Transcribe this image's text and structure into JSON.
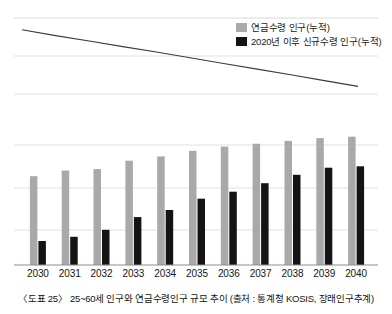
{
  "caption": "〈도표 25〉 25~60세 인구와 연금수령인구 규모 추이 (출처 : 통계청 KOSIS, 장래인구추계)",
  "legend": {
    "items": [
      {
        "label": "연금수령 인구(누적)",
        "color": "#a9a9a9",
        "swatch_name": "legend-swatch-gray"
      },
      {
        "label": "2020년 이후 신규수령 인구(누적)",
        "color": "#141414",
        "swatch_name": "legend-swatch-black"
      }
    ]
  },
  "colors": {
    "series_pension": "#a9a9a9",
    "series_new": "#141414",
    "line": "#3a3a3a",
    "grid": "#d9d9d9",
    "axis": "#8c8c8c"
  },
  "chart_data": [
    {
      "type": "line",
      "title": "",
      "xlabel": "",
      "ylabel": "",
      "grid": true,
      "legend_position": "top-right",
      "series": [
        {
          "name": "25~60세 인구",
          "x": [
            2030,
            2031,
            2032,
            2033,
            2034,
            2035,
            2036,
            2037,
            2038,
            2039,
            2040
          ],
          "values": [
            100,
            97.5,
            95.2,
            92.8,
            90.5,
            88.0,
            85.6,
            83.2,
            80.8,
            78.3,
            75.8
          ]
        }
      ],
      "ylim": [
        70,
        105
      ]
    },
    {
      "type": "bar",
      "title": "",
      "xlabel": "",
      "ylabel": "",
      "grid": true,
      "categories": [
        "2030",
        "2031",
        "2032",
        "2033",
        "2034",
        "2035",
        "2036",
        "2037",
        "2038",
        "2039",
        "2040"
      ],
      "ylim": [
        0,
        100
      ],
      "series": [
        {
          "name": "연금수령 인구(누적)",
          "color": "#a9a9a9",
          "values": [
            63,
            67,
            68,
            74,
            77,
            81,
            84,
            86,
            88,
            90,
            91
          ]
        },
        {
          "name": "2020년 이후 신규수령 인구(누적)",
          "color": "#141414",
          "values": [
            17,
            20,
            25,
            34,
            39,
            47,
            52,
            58,
            64,
            69,
            70
          ]
        }
      ]
    }
  ]
}
